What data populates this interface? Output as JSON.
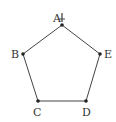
{
  "diagram": {
    "type": "regular-pentagon",
    "stroke_color": "#444444",
    "vertex_color": "#222222",
    "vertices": [
      {
        "label": "A",
        "x": 62,
        "y": 25,
        "lx": 53,
        "ly": 22
      },
      {
        "label": "B",
        "x": 23,
        "y": 54,
        "lx": 11,
        "ly": 58
      },
      {
        "label": "C",
        "x": 38,
        "y": 101,
        "lx": 33,
        "ly": 116
      },
      {
        "label": "D",
        "x": 86,
        "y": 101,
        "lx": 82,
        "ly": 116
      },
      {
        "label": "E",
        "x": 100,
        "y": 54,
        "lx": 104,
        "ly": 58
      }
    ],
    "marker": {
      "name": "pin-icon",
      "glyph": "⫯",
      "at": "A"
    }
  }
}
